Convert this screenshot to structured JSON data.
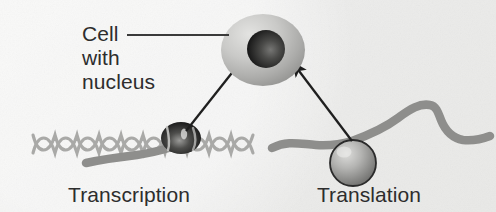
{
  "figure": {
    "background_color": "#efefed"
  },
  "labels": {
    "cell_line1": "Cell",
    "cell_line2": "with",
    "cell_line3": "nucleus",
    "transcription": "Transcription",
    "translation": "Translation"
  },
  "palette": {
    "text": "#2d2d2d",
    "leader_line": "#3a3a3a",
    "arrow": "#1f1f1f",
    "dna_strand": "#a9a9a7",
    "mrna_strand": "#8e8e8c",
    "cell_body_light": "#d8d8d6",
    "cell_body_dark": "#9a9a98",
    "nucleus_light": "#6e6e6c",
    "nucleus_dark": "#1c1c1c",
    "polymerase_light": "#8a8a88",
    "polymerase_dark": "#141414",
    "ribosome_light": "#d2d2d0",
    "ribosome_dark": "#6a6a68",
    "ribosome_outline": "#2b2b2b"
  },
  "elements": {
    "cell": "cell-ellipse",
    "nucleus": "nucleus-sphere",
    "dna": "dna-double-helix",
    "polymerase": "rna-polymerase",
    "mrna_left": "mrna-strand-transcription",
    "mrna_right": "mrna-strand-translation",
    "ribosome": "ribosome-sphere",
    "arrow_left": "arrow-transcription-to-nucleus",
    "arrow_right": "arrow-translation-to-cell",
    "leader": "cell-label-leader-line"
  }
}
